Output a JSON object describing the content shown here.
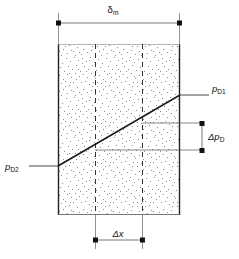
{
  "figure": {
    "background": "#ffffff",
    "ink_color": "#111111",
    "stipple_color": "#7a7a7a"
  },
  "labels": {
    "delta_m": {
      "symbol": "δ",
      "subscript": "m",
      "full": "δm"
    },
    "delta_x": {
      "symbol": "Δx",
      "italic_part": "x",
      "full": "Δx"
    },
    "delta_pD": {
      "symbol": "Δp",
      "subscript": "D",
      "full": "ΔpD"
    },
    "p_D1": {
      "symbol": "p",
      "subscript": "D1",
      "full": "pD1"
    },
    "p_D2": {
      "symbol": "p",
      "subscript": "D2",
      "full": "pD2"
    }
  },
  "geometry": {
    "box": {
      "left": 58,
      "right": 180,
      "top": 44,
      "bottom": 215
    },
    "dashed_lines_x": [
      95,
      142
    ],
    "diagonal": {
      "x1": 58,
      "y1": 166,
      "x2": 180,
      "y2": 95
    },
    "delta_m_dimension": {
      "y": 23,
      "x1": 58,
      "x2": 180
    },
    "delta_x_dimension": {
      "y": 240,
      "x1": 95,
      "x2": 142
    },
    "delta_pD_dimension": {
      "x": 202,
      "y1": 123,
      "y2": 150
    },
    "leader_pD1": {
      "x1": 180,
      "x2": 210,
      "y": 95
    },
    "leader_pD2": {
      "x1": 30,
      "x2": 58,
      "y": 166
    }
  }
}
